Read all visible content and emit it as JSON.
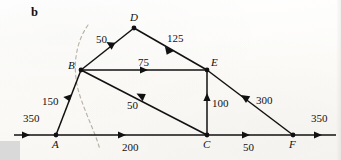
{
  "figure": {
    "panel_label": "b",
    "type": "network-flow-diagram",
    "ink_color": "#111111",
    "cut_arc_color": "#b9b2a6",
    "background_color": "#fdfdfb"
  },
  "vertices": [
    {
      "id": "A",
      "label": "A",
      "x": 56,
      "y": 135
    },
    {
      "id": "B",
      "label": "B",
      "x": 81,
      "y": 70
    },
    {
      "id": "C",
      "label": "C",
      "x": 207,
      "y": 135
    },
    {
      "id": "D",
      "label": "D",
      "x": 134,
      "y": 28
    },
    {
      "id": "E",
      "label": "E",
      "x": 207,
      "y": 70
    },
    {
      "id": "F",
      "label": "F",
      "x": 293,
      "y": 135
    }
  ],
  "edges": [
    {
      "id": "source-in",
      "from": "source",
      "to": "A",
      "weight": "350",
      "label_x": 23,
      "label_y": 113
    },
    {
      "id": "A-B",
      "from": "A",
      "to": "B",
      "weight": "150",
      "label_x": 42,
      "label_y": 96
    },
    {
      "id": "B-D",
      "from": "B",
      "to": "D",
      "weight": "50",
      "label_x": 96,
      "label_y": 34
    },
    {
      "id": "D-E",
      "from": "D",
      "to": "E",
      "weight": "125",
      "label_x": 167,
      "label_y": 33
    },
    {
      "id": "B-E",
      "from": "B",
      "to": "E",
      "weight": "75",
      "label_x": 138,
      "label_y": 57
    },
    {
      "id": "C-B",
      "from": "C",
      "to": "B",
      "weight": "50",
      "label_x": 127,
      "label_y": 100
    },
    {
      "id": "C-E",
      "from": "C",
      "to": "E",
      "weight": "100",
      "label_x": 212,
      "label_y": 98
    },
    {
      "id": "A-C",
      "from": "A",
      "to": "C",
      "weight": "200",
      "label_x": 122,
      "label_y": 142
    },
    {
      "id": "F-E",
      "from": "F",
      "to": "E",
      "weight": "300",
      "label_x": 256,
      "label_y": 95
    },
    {
      "id": "C-F",
      "from": "C",
      "to": "F",
      "weight": "50",
      "label_x": 243,
      "label_y": 142
    },
    {
      "id": "sink-out",
      "from": "F",
      "to": "sink",
      "weight": "350",
      "label_x": 311,
      "label_y": 113
    }
  ],
  "axis": {
    "y": 135,
    "x_start": 14,
    "x_end": 336
  },
  "cut_arc": {
    "description": "dashed cut curve",
    "path": "M 88 25 C 74 45, 72 72, 80 96 C 88 120, 96 134, 100 150"
  }
}
